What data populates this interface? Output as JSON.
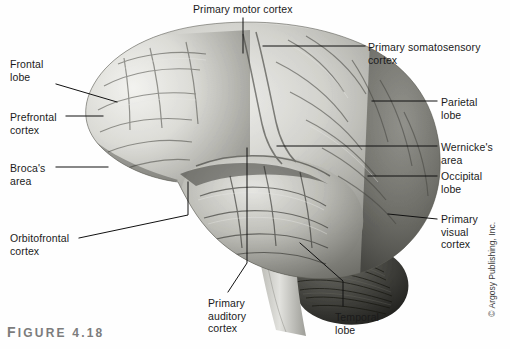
{
  "figure": {
    "caption_prefix": "F",
    "caption_rest": "IGURE",
    "caption_number": "4.18",
    "caption_full": "FIGURE 4.18",
    "copyright": "© Argosy Publishing, Inc.",
    "background_color": "#fefefe",
    "leader_line_color": "#111111",
    "text_color": "#1b1b1b",
    "caption_color": "#7c7c7c"
  },
  "labels": [
    {
      "id": "primary-motor-cortex",
      "text": "Primary motor cortex",
      "x": 193,
      "y": 3,
      "align": "left"
    },
    {
      "id": "primary-somatosensory-cortex",
      "text": "Primary somatosensory cortex",
      "x": 368,
      "y": 41,
      "align": "left"
    },
    {
      "id": "frontal-lobe",
      "text": "Frontal\nlobe",
      "x": 10,
      "y": 58,
      "align": "left"
    },
    {
      "id": "parietal-lobe",
      "text": "Parietal\nlobe",
      "x": 441,
      "y": 96,
      "align": "left"
    },
    {
      "id": "prefrontal-cortex",
      "text": "Prefrontal\ncortex",
      "x": 10,
      "y": 111,
      "align": "left"
    },
    {
      "id": "wernickes-area",
      "text": "Wernicke's\narea",
      "x": 441,
      "y": 141,
      "align": "left"
    },
    {
      "id": "brocas-area",
      "text": "Broca's\narea",
      "x": 10,
      "y": 162,
      "align": "left"
    },
    {
      "id": "occipital-lobe",
      "text": "Occipital\nlobe",
      "x": 441,
      "y": 170,
      "align": "left"
    },
    {
      "id": "primary-visual-cortex",
      "text": "Primary\nvisual\ncortex",
      "x": 441,
      "y": 213,
      "align": "left"
    },
    {
      "id": "orbitofrontal-cortex",
      "text": "Orbitofrontal\ncortex",
      "x": 10,
      "y": 232,
      "align": "left"
    },
    {
      "id": "primary-auditory-cortex",
      "text": "Primary\nauditory\ncortex",
      "x": 208,
      "y": 297,
      "align": "left"
    },
    {
      "id": "temporal-lobe",
      "text": "Temporal\nlobe",
      "x": 335,
      "y": 311,
      "align": "left"
    }
  ],
  "leader_lines": [
    {
      "id": "leader-primary-motor-cortex",
      "points": "243,18 243,53"
    },
    {
      "id": "leader-primary-somatosensory-cortex",
      "points": "365,46 263,46"
    },
    {
      "id": "leader-frontal-lobe",
      "points": "56,84 117,102"
    },
    {
      "id": "leader-parietal-lobe",
      "points": "437,101 372,101"
    },
    {
      "id": "leader-prefrontal-cortex",
      "points": "66,116 103,116"
    },
    {
      "id": "leader-wernickes-area",
      "points": "437,146 277,146"
    },
    {
      "id": "leader-brocas-area",
      "points": "56,167 108,167"
    },
    {
      "id": "leader-occipital-lobe",
      "points": "437,176 368,176"
    },
    {
      "id": "leader-primary-visual-cortex",
      "points": "437,219 388,214"
    },
    {
      "id": "leader-orbitofrontal-cortex",
      "points": "79,238 188,215 188,182"
    },
    {
      "id": "leader-primary-auditory-cortex",
      "points": "228,292 247,263 247,148"
    },
    {
      "id": "leader-temporal-lobe",
      "points": "343,306 343,281 300,243"
    }
  ],
  "anatomy_regions": [
    {
      "id": "frontal-lobe-region",
      "name": "Frontal lobe"
    },
    {
      "id": "parietal-lobe-region",
      "name": "Parietal lobe"
    },
    {
      "id": "temporal-lobe-region",
      "name": "Temporal lobe"
    },
    {
      "id": "occipital-lobe-region",
      "name": "Occipital lobe"
    },
    {
      "id": "cerebellum-region",
      "name": "Cerebellum"
    },
    {
      "id": "brainstem-region",
      "name": "Brainstem"
    }
  ]
}
